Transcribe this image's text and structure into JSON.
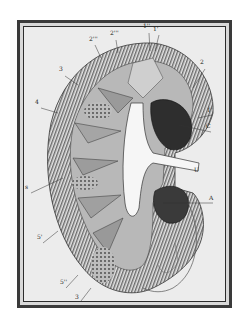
{
  "figure": {
    "labels": [
      {
        "id": "2'''",
        "x": 113,
        "y": 33
      },
      {
        "id": "2'''",
        "x": 92,
        "y": 38
      },
      {
        "id": "1''",
        "x": 145,
        "y": 26
      },
      {
        "id": "1'",
        "x": 155,
        "y": 29
      },
      {
        "id": "3",
        "x": 61,
        "y": 69
      },
      {
        "id": "2",
        "x": 202,
        "y": 62
      },
      {
        "id": "4",
        "x": 37,
        "y": 102
      },
      {
        "id": "1'",
        "x": 209,
        "y": 110
      },
      {
        "id": "C",
        "x": 208,
        "y": 126
      },
      {
        "id": "U",
        "x": 196,
        "y": 170
      },
      {
        "id": "s",
        "x": 27,
        "y": 187
      },
      {
        "id": "A",
        "x": 211,
        "y": 198
      },
      {
        "id": "5'",
        "x": 39,
        "y": 237
      },
      {
        "id": "5''",
        "x": 62,
        "y": 282
      },
      {
        "id": "3",
        "x": 77,
        "y": 297
      }
    ]
  },
  "colors": {
    "frame_outer": "#3a3a3a",
    "frame_inner": "#2c2c2c",
    "paper": "#ececec",
    "ink": "#333333"
  }
}
